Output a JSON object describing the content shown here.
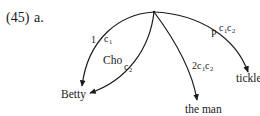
{
  "example": {
    "number": "(45)",
    "letter": "a."
  },
  "root": {
    "x": 154,
    "y": 12
  },
  "arcs": [
    {
      "id": "arc-betty",
      "target": "Betty",
      "relation_label": "1",
      "sequence_label": {
        "base": "c",
        "subs": [
          "1"
        ]
      }
    },
    {
      "id": "arc-cho",
      "target": "Betty",
      "relation_label": "Cho",
      "sequence_label": {
        "base": "c",
        "subs": [
          "2"
        ]
      }
    },
    {
      "id": "arc-the-man",
      "target": "the man",
      "relation_label": "2",
      "sequence_label": {
        "base": "c",
        "subs": [
          "1",
          "2"
        ]
      }
    },
    {
      "id": "arc-tickle",
      "target": "tickle",
      "relation_label": "P",
      "sequence_label": {
        "base": "c",
        "subs": [
          "1",
          "2"
        ]
      }
    }
  ],
  "nodes": {
    "betty": "Betty",
    "the_man": "the man",
    "tickle": "tickle"
  },
  "labels": {
    "arc1_rel": "1",
    "arc2_rel": "Cho",
    "arc3_rel": "2",
    "arc4_rel": "P",
    "c": "c",
    "s1": "1",
    "s2": "2"
  },
  "colors": {
    "line": "#1a1a1a",
    "background": "#ffffff"
  }
}
